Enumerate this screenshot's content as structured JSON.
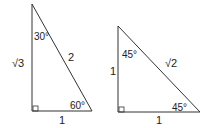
{
  "diagram": {
    "triangles": [
      {
        "name": "30-60-90 triangle",
        "angles": {
          "top": "30°",
          "bottom_right": "60°",
          "bottom_left": "right angle"
        },
        "sides": {
          "vertical": "√3",
          "hypotenuse": "2",
          "base": "1"
        }
      },
      {
        "name": "45-45-90 triangle",
        "angles": {
          "top": "45°",
          "bottom_right": "45°",
          "bottom_left": "right angle"
        },
        "sides": {
          "vertical": "1",
          "hypotenuse": "√2",
          "base": "1"
        }
      }
    ]
  }
}
